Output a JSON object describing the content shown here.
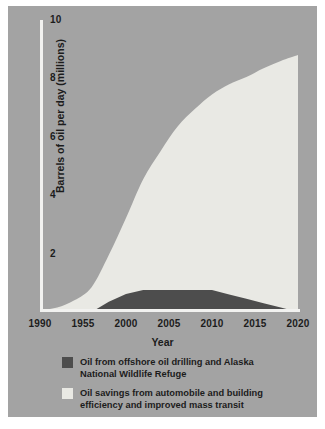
{
  "figure": {
    "background_color": "#a3a3a3",
    "page_color": "#ffffff",
    "axis_color": "#f2f2f0"
  },
  "chart_data": {
    "type": "area",
    "stacked": true,
    "title": "",
    "xlabel": "Year",
    "ylabel": "Barrels of oil per day (millions)",
    "xlim": [
      1990,
      2020
    ],
    "ylim": [
      0,
      10
    ],
    "grid": false,
    "legend_position": "below",
    "x_tick_labels": [
      "1990",
      "1955",
      "2000",
      "2005",
      "2010",
      "2015",
      "2020"
    ],
    "x_tick_values": [
      1990,
      1995,
      2000,
      2005,
      2010,
      2015,
      2020
    ],
    "y_tick_labels": [
      "2",
      "4",
      "6",
      "8",
      "10"
    ],
    "y_tick_values": [
      2,
      4,
      6,
      8,
      10
    ],
    "x": [
      1990,
      1992,
      1994,
      1996,
      1998,
      2000,
      2002,
      2004,
      2006,
      2008,
      2010,
      2012,
      2014,
      2016,
      2018,
      2020
    ],
    "series": [
      {
        "name": "Oil from offshore oil drilling and Alaska National Wildlife Refuge",
        "color": "#4d4d4d",
        "values": [
          0,
          0,
          0,
          0,
          0.35,
          0.62,
          0.75,
          0.75,
          0.75,
          0.75,
          0.75,
          0.6,
          0.45,
          0.3,
          0.15,
          0
        ]
      },
      {
        "name": "Oil savings from automobile and building efficiency and improved mass transit",
        "color": "#e9e9e4",
        "values": [
          0.05,
          0.15,
          0.4,
          0.85,
          1.6,
          2.6,
          3.8,
          4.75,
          5.6,
          6.2,
          6.7,
          7.2,
          7.6,
          8.05,
          8.45,
          8.8
        ]
      }
    ],
    "total_top": [
      0.05,
      0.15,
      0.4,
      0.85,
      1.95,
      3.22,
      4.55,
      5.5,
      6.35,
      6.95,
      7.45,
      7.8,
      8.05,
      8.35,
      8.6,
      8.8
    ]
  },
  "legend": {
    "entries": [
      {
        "swatch_color": "#4d4d4d",
        "line1": "Oil from offshore oil drilling and Alaska",
        "line2": "National Wildlife Refuge"
      },
      {
        "swatch_color": "#e9e9e4",
        "line1": "Oil savings from automobile and building",
        "line2": "efficiency and improved mass transit"
      }
    ]
  }
}
